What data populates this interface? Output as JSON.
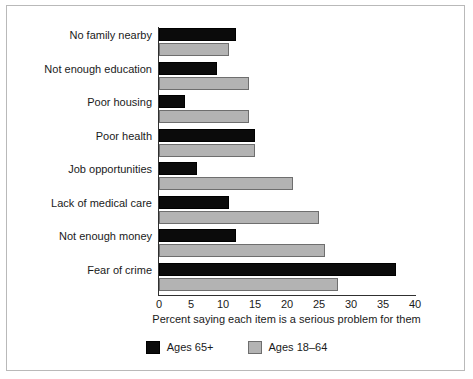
{
  "chart_data": {
    "type": "bar",
    "orientation": "horizontal",
    "title": "",
    "xlabel": "Percent saying each item is a serious problem for them",
    "ylabel": "",
    "xlim": [
      0,
      40
    ],
    "xticks": [
      0,
      5,
      10,
      15,
      20,
      25,
      30,
      35,
      40
    ],
    "grid": false,
    "legend_position": "bottom",
    "categories": [
      "No family nearby",
      "Not enough education",
      "Poor housing",
      "Poor health",
      "Job opportunities",
      "Lack of medical care",
      "Not enough money",
      "Fear of crime"
    ],
    "series": [
      {
        "name": "Ages 65+",
        "color": "#0b0b0b",
        "values": [
          12,
          9,
          4,
          15,
          6,
          11,
          12,
          37
        ]
      },
      {
        "name": "Ages 18–64",
        "color": "#b3b3b3",
        "values": [
          11,
          14,
          14,
          15,
          21,
          25,
          26,
          28
        ]
      }
    ]
  },
  "axis": {
    "x_title": "Percent saying each item is a serious problem for them",
    "tick_labels": [
      "0",
      "5",
      "10",
      "15",
      "20",
      "25",
      "30",
      "35",
      "40"
    ]
  },
  "legend": {
    "items": [
      {
        "label": "Ages 65+",
        "swatch": "dark"
      },
      {
        "label": "Ages 18–64",
        "swatch": "light"
      }
    ]
  }
}
